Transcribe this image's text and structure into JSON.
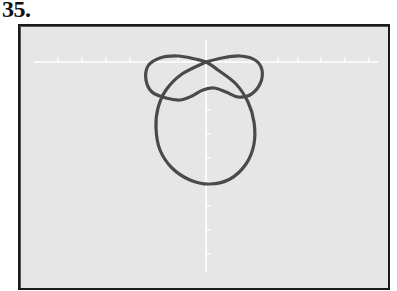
{
  "problem_number": "35.",
  "chart_data": {
    "type": "line",
    "title": "",
    "subtitle": "",
    "xlabel": "",
    "ylabel": "",
    "grid": false,
    "legend": null,
    "axes": {
      "x_axis_pixel_y": 62,
      "x_axis_pixel_range": [
        34,
        378
      ],
      "y_axis_pixel_x": 206,
      "y_axis_pixel_range": [
        40,
        272
      ],
      "x_tick_pixels": [
        58,
        82,
        106,
        130,
        154,
        178,
        230,
        254,
        278,
        298,
        321,
        345,
        369
      ],
      "y_tick_pixels": [
        86,
        110,
        134,
        158,
        182,
        206,
        230,
        254
      ]
    },
    "series": [
      {
        "name": "curve",
        "color": "#4a4a4a",
        "points_pixel": [
          [
            206,
            62
          ],
          [
            222,
            58
          ],
          [
            240,
            56
          ],
          [
            255,
            60
          ],
          [
            262,
            70
          ],
          [
            260,
            84
          ],
          [
            250,
            95
          ],
          [
            238,
            97
          ],
          [
            226,
            92
          ],
          [
            214,
            88
          ],
          [
            203,
            90
          ],
          [
            192,
            96
          ],
          [
            180,
            100
          ],
          [
            166,
            98
          ],
          [
            152,
            92
          ],
          [
            146,
            80
          ],
          [
            148,
            66
          ],
          [
            160,
            58
          ],
          [
            178,
            56
          ],
          [
            195,
            59
          ],
          [
            206,
            62
          ],
          [
            218,
            70
          ],
          [
            236,
            84
          ],
          [
            248,
            102
          ],
          [
            254,
            122
          ],
          [
            254,
            144
          ],
          [
            246,
            164
          ],
          [
            230,
            179
          ],
          [
            210,
            184
          ],
          [
            190,
            180
          ],
          [
            172,
            168
          ],
          [
            160,
            150
          ],
          [
            156,
            128
          ],
          [
            158,
            108
          ],
          [
            166,
            90
          ],
          [
            182,
            74
          ],
          [
            206,
            62
          ]
        ]
      }
    ]
  },
  "colors": {
    "screen_background": "#e6e6e6",
    "frame": "#1a1a1a",
    "axis": "#ffffff",
    "curve": "#4a4a4a"
  }
}
